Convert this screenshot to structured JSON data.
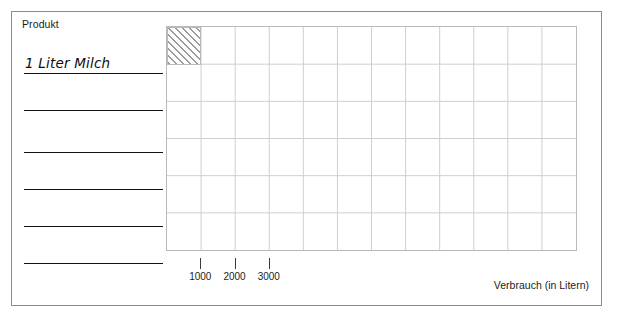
{
  "worksheet": {
    "product_column_header": "Produkt",
    "rows": [
      {
        "label": "1 Liter Milch"
      },
      {
        "label": ""
      },
      {
        "label": ""
      },
      {
        "label": ""
      },
      {
        "label": ""
      },
      {
        "label": ""
      }
    ]
  },
  "chart_data": {
    "type": "bar",
    "title": "",
    "xlabel": "Verbrauch (in Litern)",
    "ylabel": "Produkt",
    "orientation": "horizontal",
    "grid": true,
    "legend": false,
    "xlim": [
      0,
      12000
    ],
    "xticks": [
      1000,
      2000,
      3000
    ],
    "xtick_labels": [
      "1000",
      "2000",
      "3000"
    ],
    "gridline_step": 1000,
    "categories": [
      "1 Liter Milch",
      "",
      "",
      "",
      "",
      ""
    ],
    "values": [
      1000,
      0,
      0,
      0,
      0,
      0
    ],
    "bar_style": "diagonal-hatch",
    "bar_fill": "#ffffff",
    "bar_hatch_color": "#9a9a9a",
    "bar_border_color": "#b9b9b9"
  },
  "style": {
    "frame_color": "#8d8d8d",
    "grid_color": "#cfcfcf",
    "rule_color": "#111111",
    "text_color": "#1c1c1c",
    "background": "#ffffff"
  }
}
